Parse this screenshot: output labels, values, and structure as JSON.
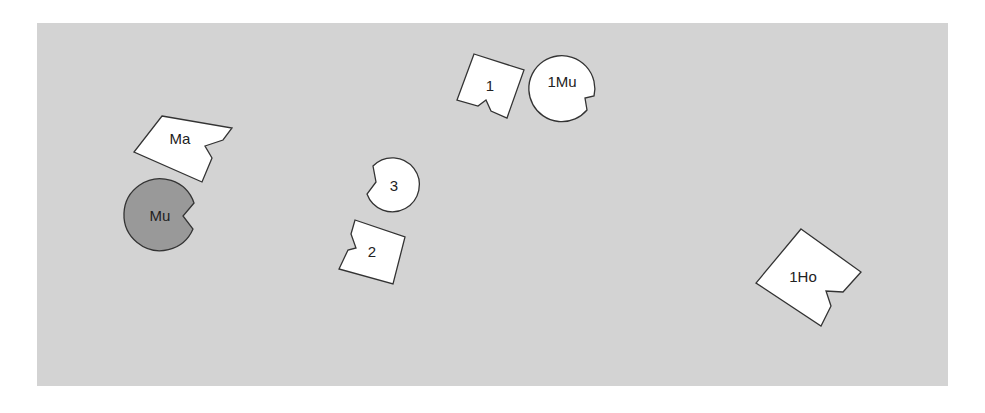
{
  "diagram": {
    "background": {
      "x": 37,
      "y": 23,
      "width": 911,
      "height": 363,
      "color": "#d3d3d3"
    },
    "stroke_color": "#333333",
    "shapes": [
      {
        "id": "Ma",
        "label": "Ma",
        "kind": "notched-square",
        "fill": "#ffffff",
        "points": "162,116 232,128 223,140 205,146 212,158 202,182 134,152",
        "label_x": 180,
        "label_y": 144
      },
      {
        "id": "Mu",
        "label": "Mu",
        "kind": "notched-circle",
        "fill": "#999999",
        "cx": 160,
        "cy": 215,
        "r": 36,
        "path": "M 194,203 A 36 36 0 1 0 193,229 L 183,216 Z",
        "label_x": 160,
        "label_y": 221
      },
      {
        "id": "1",
        "label": "1",
        "kind": "notched-square",
        "fill": "#ffffff",
        "points": "474,54 524,70 507,118 491,111 486,100 478,106 457,100",
        "label_x": 490,
        "label_y": 91
      },
      {
        "id": "1Mu",
        "label": "1Mu",
        "kind": "notched-circle",
        "fill": "#ffffff",
        "cx": 562,
        "cy": 82,
        "r": 33,
        "path": "M 594,96 A 33 33 0 1 0 587,110 L 585,98 Z",
        "label_x": 562,
        "label_y": 87
      },
      {
        "id": "3",
        "label": "3",
        "kind": "notched-circle",
        "fill": "#ffffff",
        "cx": 392,
        "cy": 185,
        "r": 27,
        "path": "M 373,166 A 27 27 0 1 1 367,194 L 376,182 Z",
        "label_x": 394,
        "label_y": 191
      },
      {
        "id": "2",
        "label": "2",
        "kind": "notched-square",
        "fill": "#ffffff",
        "points": "355,220 405,237 393,284 339,269 348,250 356,248 351,234",
        "label_x": 372,
        "label_y": 257
      },
      {
        "id": "1Ho",
        "label": "1Ho",
        "kind": "notched-square",
        "fill": "#ffffff",
        "points": "801,229 861,272 843,292 826,291 831,306 821,326 756,283",
        "label_x": 803,
        "label_y": 282
      }
    ]
  }
}
